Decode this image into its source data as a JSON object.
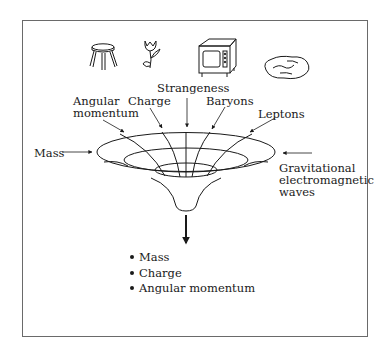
{
  "diagram": {
    "objects": [
      "stool",
      "flower",
      "microwave",
      "rock"
    ],
    "inputs": {
      "mass": "Mass",
      "angular_momentum_line1": "Angular",
      "angular_momentum_line2": "momentum",
      "charge": "Charge",
      "strangeness": "Strangeness",
      "baryons": "Baryons",
      "leptons": "Leptons",
      "waves_line1": "Gravitational",
      "waves_line2": "electromagnetic",
      "waves_line3": "waves"
    },
    "outputs": [
      "Mass",
      "Charge",
      "Angular momentum"
    ],
    "colors": {
      "ink": "#1a1a1a",
      "frame": "#6a6a6a",
      "background": "#ffffff"
    }
  }
}
